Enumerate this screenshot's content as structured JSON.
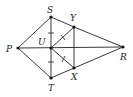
{
  "diagram": {
    "type": "geometry-figure",
    "points": [
      {
        "name": "P",
        "x": 18,
        "y": 48,
        "label_x": 6,
        "label_y": 52
      },
      {
        "name": "S",
        "x": 51,
        "y": 17,
        "label_x": 46,
        "label_y": 12
      },
      {
        "name": "Y",
        "x": 74,
        "y": 27,
        "label_x": 70,
        "label_y": 21
      },
      {
        "name": "U",
        "x": 51,
        "y": 48,
        "label_x": 38,
        "label_y": 44
      },
      {
        "name": "R",
        "x": 123,
        "y": 47,
        "label_x": 120,
        "label_y": 60
      },
      {
        "name": "X",
        "x": 74,
        "y": 68,
        "label_x": 71,
        "label_y": 80
      },
      {
        "name": "T",
        "x": 51,
        "y": 78,
        "label_x": 48,
        "label_y": 91
      }
    ],
    "segments": [
      "PS",
      "PT",
      "PR",
      "ST",
      "SY",
      "YR",
      "TX",
      "XR",
      "YX",
      "UY",
      "UX"
    ],
    "tick_marks": [
      {
        "segment": "SU",
        "count": 1
      },
      {
        "segment": "UT",
        "count": 1
      },
      {
        "segment": "UY",
        "count": 1
      },
      {
        "segment": "UX",
        "count": 1
      }
    ],
    "labels": {
      "P": "P",
      "S": "S",
      "Y": "Y",
      "U": "U",
      "R": "R",
      "X": "X",
      "T": "T"
    }
  }
}
